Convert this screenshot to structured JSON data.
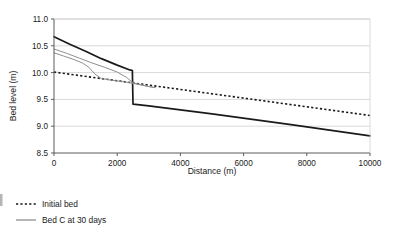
{
  "chart_data": {
    "type": "line",
    "title": "",
    "xlabel": "Distance (m)",
    "ylabel": "Bed level (m)",
    "xlim": [
      0,
      10000
    ],
    "ylim": [
      8.5,
      11.0
    ],
    "xticks": [
      0,
      2000,
      4000,
      6000,
      8000,
      10000
    ],
    "yticks": [
      8.5,
      9.0,
      9.5,
      10.0,
      10.5,
      11.0
    ],
    "xtick_labels": [
      "0",
      "2000",
      "4000",
      "6000",
      "8000",
      "10000"
    ],
    "ytick_labels": [
      "8.5",
      "9.0",
      "9.5",
      "10.0",
      "10.5",
      "11.0"
    ],
    "grid": "horizontal",
    "legend_position": "below-left",
    "series": [
      {
        "name": "Initial bed",
        "style": "dotted",
        "color": "#1a1a1a",
        "width": 1.6,
        "x": [
          0,
          10000
        ],
        "y": [
          10.01,
          9.2
        ]
      },
      {
        "name": "Bed C at 30 days",
        "style": "solid",
        "color": "#1a1a1a",
        "width": 1.7,
        "x": [
          0,
          500,
          1000,
          1500,
          2000,
          2400,
          2480,
          2500,
          3000,
          5000,
          7500,
          10000
        ],
        "y": [
          10.67,
          10.53,
          10.4,
          10.26,
          10.14,
          10.05,
          10.04,
          9.41,
          9.38,
          9.23,
          9.03,
          8.82
        ]
      },
      {
        "name": "Intermediate bed A",
        "style": "solid",
        "color": "#8f8f8f",
        "width": 1.0,
        "x": [
          0,
          400,
          800,
          1200,
          1600,
          2000,
          2300,
          2500,
          3000,
          3200
        ],
        "y": [
          10.44,
          10.36,
          10.27,
          10.18,
          10.1,
          10.01,
          9.91,
          9.81,
          9.74,
          9.72
        ]
      },
      {
        "name": "Intermediate bed B",
        "style": "solid",
        "color": "#8f8f8f",
        "width": 1.0,
        "x": [
          0,
          300,
          600,
          900,
          1100,
          1300,
          1500,
          1800,
          2200,
          2500,
          3000,
          3200
        ],
        "y": [
          10.37,
          10.31,
          10.25,
          10.18,
          10.1,
          9.97,
          9.89,
          9.86,
          9.83,
          9.8,
          9.74,
          9.72
        ]
      }
    ],
    "legend": [
      {
        "label": "Initial bed",
        "style": "dotted",
        "color": "#1a1a1a"
      },
      {
        "label": "Bed C at 30 days",
        "style": "solid",
        "color": "#8f8f8f"
      }
    ]
  },
  "axes": {
    "y_title": "Bed level (m)",
    "x_title": "Distance (m)"
  },
  "colors": {
    "grid": "#cfcfcf",
    "axis": "#5a5a5a",
    "primary": "#1a1a1a",
    "secondary": "#8f8f8f",
    "background": "#ffffff"
  }
}
